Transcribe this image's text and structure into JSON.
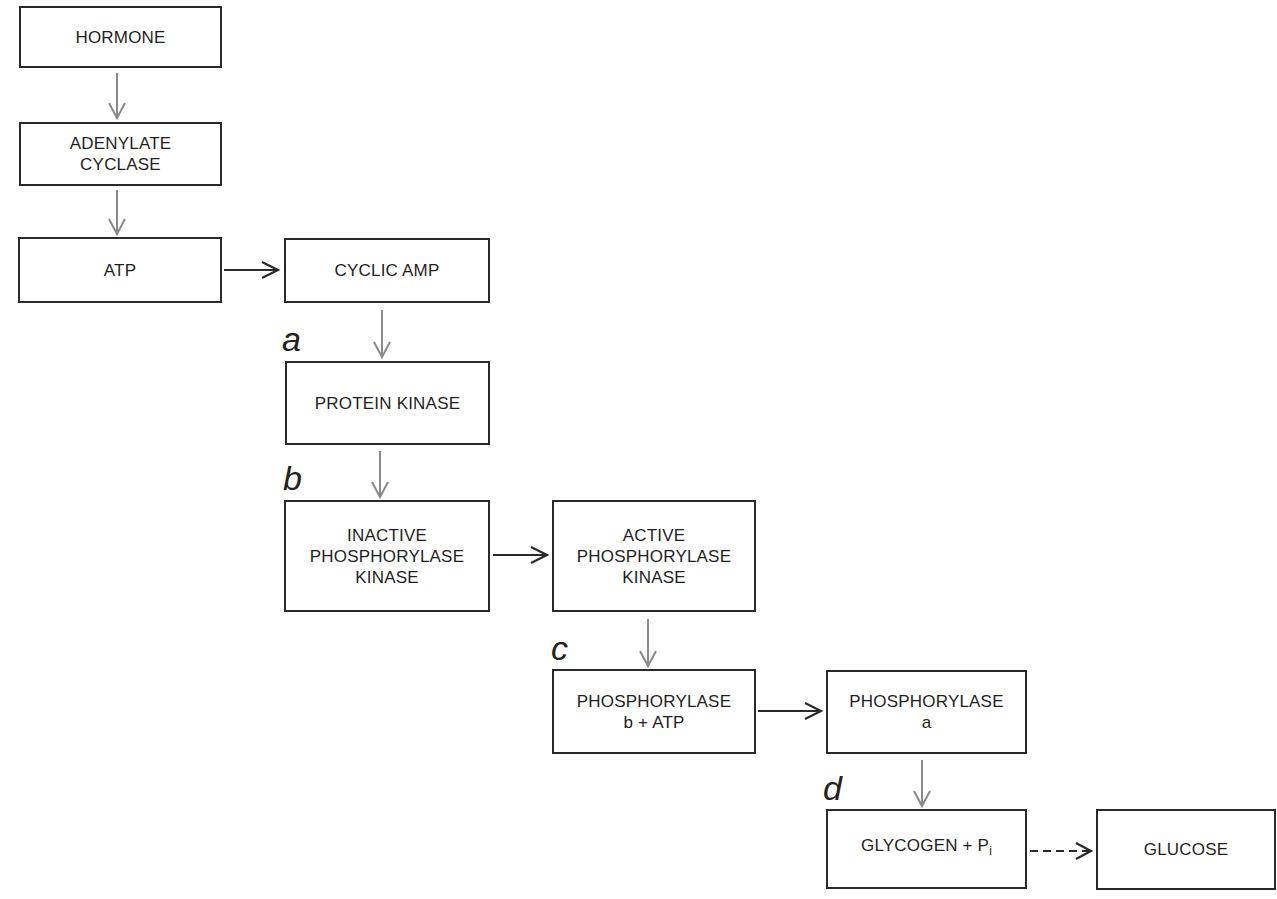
{
  "diagram": {
    "nodes": [
      {
        "id": "hormone",
        "label": "HORMONE"
      },
      {
        "id": "adenylate-cyclase",
        "label": "ADENYLATE\nCYCLASE"
      },
      {
        "id": "atp",
        "label": "ATP"
      },
      {
        "id": "cyclic-amp",
        "label": "CYCLIC AMP"
      },
      {
        "id": "protein-kinase",
        "label": "PROTEIN KINASE"
      },
      {
        "id": "inactive-phosphorylase-kinase",
        "label": "INACTIVE\nPHOSPHORYLASE\nKINASE"
      },
      {
        "id": "active-phosphorylase-kinase",
        "label": "ACTIVE\nPHOSPHORYLASE\nKINASE"
      },
      {
        "id": "phosphorylase-b-atp",
        "label": "PHOSPHORYLASE\nb + ATP"
      },
      {
        "id": "phosphorylase-a",
        "label": "PHOSPHORYLASE\na"
      },
      {
        "id": "glycogen-pi",
        "label": "GLYCOGEN + P",
        "subscript": "i"
      },
      {
        "id": "glucose",
        "label": "GLUCOSE"
      }
    ],
    "step_labels": [
      "a",
      "b",
      "c",
      "d"
    ],
    "edges": [
      {
        "from": "hormone",
        "to": "adenylate-cyclase",
        "style": "gray-solid"
      },
      {
        "from": "adenylate-cyclase",
        "to": "atp",
        "style": "gray-solid"
      },
      {
        "from": "atp",
        "to": "cyclic-amp",
        "style": "black-solid"
      },
      {
        "from": "cyclic-amp",
        "to": "protein-kinase",
        "style": "gray-solid",
        "step": "a"
      },
      {
        "from": "protein-kinase",
        "to": "inactive-phosphorylase-kinase",
        "style": "gray-solid",
        "step": "b"
      },
      {
        "from": "inactive-phosphorylase-kinase",
        "to": "active-phosphorylase-kinase",
        "style": "black-solid"
      },
      {
        "from": "active-phosphorylase-kinase",
        "to": "phosphorylase-b-atp",
        "style": "gray-solid",
        "step": "c"
      },
      {
        "from": "phosphorylase-b-atp",
        "to": "phosphorylase-a",
        "style": "black-solid"
      },
      {
        "from": "phosphorylase-a",
        "to": "glycogen-pi",
        "style": "gray-solid",
        "step": "d"
      },
      {
        "from": "glycogen-pi",
        "to": "glucose",
        "style": "black-dashed"
      }
    ],
    "colors": {
      "box_border": "#2a2a2a",
      "gray_arrow": "#8a8a8a",
      "black_arrow": "#2a2a2a"
    }
  }
}
